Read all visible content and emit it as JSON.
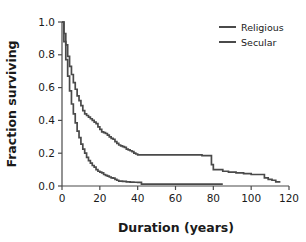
{
  "chart_data": {
    "type": "line",
    "title": "",
    "subtitle": "",
    "xlabel": "Duration (years)",
    "ylabel": "Fraction surviving",
    "xlim": [
      0,
      120
    ],
    "ylim": [
      0.0,
      1.0
    ],
    "xticks": [
      0,
      20,
      40,
      60,
      80,
      100,
      120
    ],
    "xticklabels": [
      "0",
      "20",
      "40",
      "60",
      "80",
      "100",
      "120"
    ],
    "yticks": [
      0.0,
      0.2,
      0.4,
      0.6,
      0.8,
      1.0
    ],
    "yticklabels": [
      "0.0",
      "0.2",
      "0.4",
      "0.6",
      "0.8",
      "1.0"
    ],
    "grid": false,
    "legend_position": "top-right",
    "line_color_religious": "#4a4a4a",
    "line_color_secular": "#4a4a4a",
    "axis_color": "#4a4a4a",
    "series": [
      {
        "name": "Religious",
        "color": "#4a4a4a",
        "x": [
          0,
          1,
          2,
          3,
          4,
          5,
          6,
          7,
          8,
          9,
          10,
          11,
          12,
          13,
          14,
          15,
          16,
          17,
          18,
          19,
          20,
          21,
          22,
          23,
          24,
          25,
          26,
          27,
          28,
          29,
          30,
          31,
          32,
          33,
          34,
          35,
          36,
          37,
          38,
          39,
          40,
          42,
          45,
          50,
          55,
          60,
          65,
          70,
          74,
          77,
          78,
          79,
          80,
          82,
          85,
          88,
          92,
          96,
          100,
          103,
          105,
          107,
          109,
          111,
          113,
          115
        ],
        "y": [
          1.0,
          0.93,
          0.86,
          0.79,
          0.73,
          0.68,
          0.63,
          0.59,
          0.55,
          0.52,
          0.49,
          0.46,
          0.44,
          0.43,
          0.42,
          0.41,
          0.4,
          0.39,
          0.38,
          0.36,
          0.345,
          0.33,
          0.325,
          0.32,
          0.31,
          0.3,
          0.29,
          0.285,
          0.27,
          0.26,
          0.25,
          0.245,
          0.24,
          0.235,
          0.225,
          0.22,
          0.215,
          0.21,
          0.2,
          0.195,
          0.19,
          0.19,
          0.19,
          0.19,
          0.19,
          0.19,
          0.19,
          0.19,
          0.185,
          0.185,
          0.185,
          0.13,
          0.1,
          0.1,
          0.09,
          0.085,
          0.08,
          0.075,
          0.07,
          0.07,
          0.07,
          0.05,
          0.04,
          0.035,
          0.025,
          0.02
        ]
      },
      {
        "name": "Secular",
        "color": "#4a4a4a",
        "x": [
          0,
          1,
          2,
          3,
          4,
          5,
          6,
          7,
          8,
          9,
          10,
          11,
          12,
          13,
          14,
          15,
          16,
          17,
          18,
          19,
          20,
          21,
          22,
          23,
          24,
          25,
          26,
          27,
          28,
          29,
          30,
          32,
          34,
          36,
          38,
          40,
          41,
          42,
          45,
          50,
          55,
          60,
          65,
          70,
          75,
          80,
          85
        ],
        "y": [
          1.0,
          0.88,
          0.77,
          0.67,
          0.58,
          0.5,
          0.44,
          0.385,
          0.335,
          0.295,
          0.255,
          0.225,
          0.2,
          0.175,
          0.155,
          0.14,
          0.125,
          0.115,
          0.1,
          0.09,
          0.085,
          0.08,
          0.07,
          0.065,
          0.06,
          0.055,
          0.05,
          0.048,
          0.04,
          0.035,
          0.03,
          0.028,
          0.025,
          0.024,
          0.023,
          0.022,
          0.022,
          0.012,
          0.012,
          0.012,
          0.012,
          0.012,
          0.012,
          0.012,
          0.012,
          0.012,
          0.012
        ]
      }
    ]
  },
  "legend": {
    "entries": [
      {
        "label": "Religious"
      },
      {
        "label": "Secular"
      }
    ]
  }
}
